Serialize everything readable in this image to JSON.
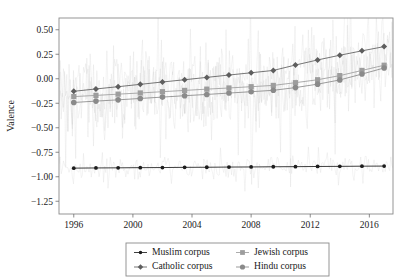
{
  "chart_data": {
    "type": "line",
    "title": "",
    "xlabel": "",
    "ylabel": "Valence",
    "xlim": [
      1995.0,
      2017.6
    ],
    "ylim": [
      -1.38,
      0.62
    ],
    "grid": false,
    "legend_position": "below-center",
    "xticks": [
      1996,
      2000,
      2004,
      2008,
      2012,
      2016
    ],
    "xtick_labels": [
      "1996",
      "2000",
      "2004",
      "2008",
      "2012",
      "2016"
    ],
    "yticks": [
      0.5,
      0.25,
      0.0,
      -0.25,
      -0.5,
      -0.75,
      -1.0,
      -1.25
    ],
    "ytick_labels": [
      "0.50",
      "0.25",
      "0.00",
      "−0.25",
      "−0.50",
      "−0.75",
      "−1.00",
      "−1.25"
    ],
    "marker_x": [
      1996.0,
      1997.5,
      1999.0,
      2000.5,
      2002.0,
      2003.5,
      2005.0,
      2006.5,
      2008.0,
      2009.5,
      2011.0,
      2012.5,
      2014.0,
      2015.5,
      2017.0
    ],
    "series": [
      {
        "name": "Muslim corpus",
        "color": "#1c1c1c",
        "marker": "circle-small",
        "values": [
          -0.912,
          -0.91,
          -0.909,
          -0.907,
          -0.906,
          -0.904,
          -0.903,
          -0.901,
          -0.9,
          -0.898,
          -0.897,
          -0.895,
          -0.894,
          -0.892,
          -0.891
        ]
      },
      {
        "name": "Catholic corpus",
        "color": "#5e5e5e",
        "marker": "diamond",
        "values": [
          -0.128,
          -0.104,
          -0.081,
          -0.057,
          -0.033,
          -0.01,
          0.014,
          0.038,
          0.061,
          0.085,
          0.14,
          0.192,
          0.24,
          0.285,
          0.328
        ]
      },
      {
        "name": "Jewish corpus",
        "color": "#9d9d9d",
        "marker": "square",
        "values": [
          -0.182,
          -0.17,
          -0.157,
          -0.145,
          -0.132,
          -0.119,
          -0.106,
          -0.094,
          -0.081,
          -0.068,
          -0.04,
          -0.01,
          0.032,
          0.085,
          0.138
        ]
      },
      {
        "name": "Hindu corpus",
        "color": "#8a8a8a",
        "marker": "circle",
        "values": [
          -0.242,
          -0.228,
          -0.215,
          -0.201,
          -0.187,
          -0.173,
          -0.16,
          -0.146,
          -0.132,
          -0.118,
          -0.09,
          -0.055,
          -0.012,
          0.048,
          0.11
        ]
      }
    ],
    "raw_traces": {
      "color": "#c9c9c9",
      "description": "noisy underlying monthly observations behind each smoothed trend",
      "note": "Muslim raw band centered near -0.91; Catholic/Jewish/Hindu raw bands overlap between +0.6 and -1.3"
    }
  },
  "legend": {
    "entries": [
      {
        "label": "Muslim corpus",
        "color": "#1c1c1c",
        "marker": "circle-small"
      },
      {
        "label": "Jewish corpus",
        "color": "#9d9d9d",
        "marker": "square"
      },
      {
        "label": "Catholic corpus",
        "color": "#5e5e5e",
        "marker": "diamond"
      },
      {
        "label": "Hindu corpus",
        "color": "#8a8a8a",
        "marker": "circle"
      }
    ]
  },
  "axes": {
    "ylabel": "Valence"
  }
}
